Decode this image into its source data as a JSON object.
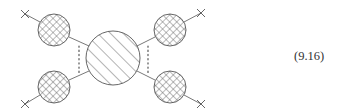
{
  "equation": {
    "number": "(9.16)"
  },
  "diagram": {
    "colors": {
      "stroke": "#555555",
      "hatch": "#6a6a6a",
      "background": "#ffffff"
    },
    "central_blob": {
      "cx": 113,
      "cy": 58,
      "r": 27,
      "fill": "diagonal-hatch"
    },
    "outer_blobs": [
      {
        "name": "top-left",
        "cx": 54,
        "cy": 30,
        "r": 16,
        "fill": "cross-hatch"
      },
      {
        "name": "bottom-left",
        "cx": 54,
        "cy": 87,
        "r": 16,
        "fill": "cross-hatch"
      },
      {
        "name": "top-right",
        "cx": 170,
        "cy": 30,
        "r": 16,
        "fill": "cross-hatch"
      },
      {
        "name": "bottom-right",
        "cx": 170,
        "cy": 87,
        "r": 16,
        "fill": "cross-hatch"
      }
    ],
    "external_vertices": [
      {
        "name": "top-left",
        "x": 25,
        "y": 14
      },
      {
        "name": "bottom-left",
        "x": 25,
        "y": 104
      },
      {
        "name": "top-right",
        "x": 201,
        "y": 13
      },
      {
        "name": "bottom-right",
        "x": 201,
        "y": 104
      }
    ],
    "dotted_lines": [
      {
        "name": "left",
        "x": 79,
        "y1": 45,
        "y2": 73
      },
      {
        "name": "right",
        "x": 148,
        "y1": 45,
        "y2": 73
      }
    ]
  }
}
